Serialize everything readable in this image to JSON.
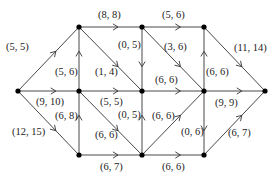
{
  "diagram": {
    "type": "flow-network",
    "colors": {
      "edge": "#333333",
      "node": "#000000",
      "label": "#222222",
      "background": "#ffffff"
    },
    "nodes": [
      {
        "id": "s",
        "x": 18,
        "y": 91
      },
      {
        "id": "A",
        "x": 79,
        "y": 27
      },
      {
        "id": "B",
        "x": 142,
        "y": 27
      },
      {
        "id": "C",
        "x": 204,
        "y": 27
      },
      {
        "id": "D",
        "x": 79,
        "y": 91
      },
      {
        "id": "E",
        "x": 142,
        "y": 91
      },
      {
        "id": "F",
        "x": 204,
        "y": 91
      },
      {
        "id": "t",
        "x": 265,
        "y": 91
      },
      {
        "id": "G",
        "x": 79,
        "y": 155
      },
      {
        "id": "H",
        "x": 142,
        "y": 155
      },
      {
        "id": "I",
        "x": 204,
        "y": 155
      }
    ],
    "edges": [
      {
        "from": "s",
        "to": "A",
        "label": "(5, 5)",
        "lx": 6,
        "ly": 50
      },
      {
        "from": "A",
        "to": "B",
        "label": "(8, 8)",
        "lx": 98,
        "ly": 18
      },
      {
        "from": "B",
        "to": "C",
        "label": "(5, 6)",
        "lx": 162,
        "ly": 18
      },
      {
        "from": "C",
        "to": "t",
        "label": "(11, 14)",
        "lx": 234,
        "ly": 51
      },
      {
        "from": "D",
        "to": "A",
        "label": "(5, 6)",
        "lx": 55,
        "ly": 75
      },
      {
        "from": "A",
        "to": "E",
        "label": "(1, 4)",
        "lx": 95,
        "ly": 75
      },
      {
        "from": "B",
        "to": "E",
        "label": "(0, 5)",
        "lx": 118,
        "ly": 48
      },
      {
        "from": "B",
        "to": "F",
        "label": "(3, 6)",
        "lx": 164,
        "ly": 50
      },
      {
        "from": "F",
        "to": "C",
        "label": "(6, 6)",
        "lx": 206,
        "ly": 75
      },
      {
        "from": "s",
        "to": "D",
        "label": "(9, 10)",
        "lx": 36,
        "ly": 105
      },
      {
        "from": "D",
        "to": "E",
        "label": "(5, 5)",
        "lx": 100,
        "ly": 105
      },
      {
        "from": "E",
        "to": "F",
        "label": "(6, 6)",
        "lx": 155,
        "ly": 83
      },
      {
        "from": "F",
        "to": "t",
        "label": "(9, 9)",
        "lx": 215,
        "ly": 106
      },
      {
        "from": "G",
        "to": "D",
        "label": "(6, 8)",
        "lx": 55,
        "ly": 119
      },
      {
        "from": "D",
        "to": "H",
        "label": "(6, 6)",
        "lx": 95,
        "ly": 138
      },
      {
        "from": "H",
        "to": "E",
        "label": "(0, 5)",
        "lx": 118,
        "ly": 118
      },
      {
        "from": "H",
        "to": "F",
        "label": "(6, 6)",
        "lx": 152,
        "ly": 119
      },
      {
        "from": "F",
        "to": "I",
        "label": "(0, 6)",
        "lx": 181,
        "ly": 135
      },
      {
        "from": "I",
        "to": "t",
        "label": "(6, 7)",
        "lx": 228,
        "ly": 136
      },
      {
        "from": "s",
        "to": "G",
        "label": "(12, 15)",
        "lx": 12,
        "ly": 135
      },
      {
        "from": "G",
        "to": "H",
        "label": "(6, 7)",
        "lx": 100,
        "ly": 170
      },
      {
        "from": "H",
        "to": "I",
        "label": "(6, 6)",
        "lx": 162,
        "ly": 170
      }
    ]
  }
}
